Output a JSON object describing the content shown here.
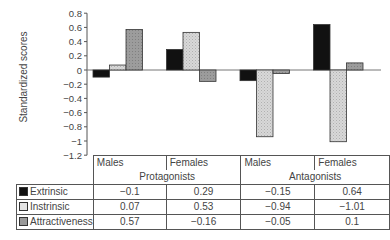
{
  "chart_data": {
    "type": "bar",
    "title": "",
    "xlabel": "",
    "ylabel": "Standardized scores",
    "ylim": [
      -1.2,
      0.8
    ],
    "yticks": [
      "0.8",
      "0.6",
      "0.4",
      "0.2",
      "0",
      "−0.2",
      "−0.4",
      "−0.6",
      "−0.8",
      "−1",
      "−1.2"
    ],
    "grid": false,
    "legend_position": "table-left",
    "groups": [
      "Protagonists",
      "Antagonists"
    ],
    "categories": [
      "Males",
      "Females",
      "Males",
      "Females"
    ],
    "series": [
      {
        "name": "Extrinsic",
        "color": "#111111",
        "values": [
          -0.1,
          0.29,
          -0.15,
          0.64
        ]
      },
      {
        "name": "Instrinsic",
        "color": "#d4d4d4",
        "values": [
          0.07,
          0.53,
          -0.94,
          -1.01
        ]
      },
      {
        "name": "Attractiveness",
        "color": "#9a9a9a",
        "values": [
          0.57,
          -0.16,
          -0.05,
          0.1
        ]
      }
    ]
  },
  "table": {
    "headers": [
      "Males",
      "Females",
      "Males",
      "Females"
    ],
    "groups": [
      "Protagonists",
      "Antagonists"
    ],
    "rows": [
      {
        "label": "Extrinsic",
        "values": [
          "−0.1",
          "0.29",
          "−0.15",
          "0.64"
        ]
      },
      {
        "label": "Instrinsic",
        "values": [
          "0.07",
          "0.53",
          "−0.94",
          "−1.01"
        ]
      },
      {
        "label": "Attractiveness",
        "values": [
          "0.57",
          "−0.16",
          "−0.05",
          "0.1"
        ]
      }
    ]
  }
}
